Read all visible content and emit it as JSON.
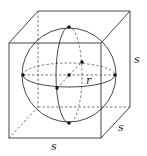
{
  "diagram": {
    "labels": {
      "edge_right": "s",
      "edge_depth": "s",
      "edge_bottom": "s",
      "radius": "r"
    },
    "colors": {
      "stroke": "#333333",
      "dashed": "#555555",
      "background": "#ffffff"
    }
  }
}
